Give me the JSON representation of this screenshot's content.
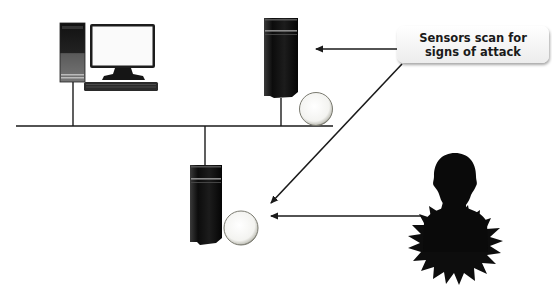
{
  "diagram": {
    "callout": {
      "line1": "Sensors scan for",
      "line2": "signs of attack"
    },
    "nodes": [
      {
        "id": "workstation",
        "type": "desktop-computer",
        "icon": "desktop-computer-icon"
      },
      {
        "id": "server-top",
        "type": "server-with-sensor",
        "icon": "server-tower-icon",
        "sensor_icon": "sensor-lens-icon"
      },
      {
        "id": "server-bottom",
        "type": "server-with-sensor",
        "icon": "server-tower-icon",
        "sensor_icon": "sensor-lens-icon"
      },
      {
        "id": "attacker",
        "type": "attacker",
        "icon": "person-silhouette-icon",
        "burst_icon": "starburst-icon"
      }
    ],
    "edges": [
      {
        "from": "callout",
        "to": "server-top",
        "kind": "arrow"
      },
      {
        "from": "callout",
        "to": "server-bottom",
        "kind": "arrow"
      },
      {
        "from": "attacker",
        "to": "server-bottom",
        "kind": "arrow"
      },
      {
        "from": "workstation",
        "to": "network-bus",
        "kind": "line"
      },
      {
        "from": "server-top",
        "to": "network-bus",
        "kind": "line"
      },
      {
        "from": "server-bottom",
        "to": "network-bus",
        "kind": "line"
      }
    ],
    "colors": {
      "line": "#1a1a1a",
      "tower": "#141414",
      "callout_bg": "#f2f2f2",
      "background": "#ffffff"
    }
  }
}
